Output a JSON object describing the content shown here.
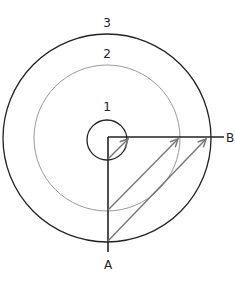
{
  "diagram": {
    "circles": [
      {
        "label": "1",
        "r": 20,
        "stroke": "#222222"
      },
      {
        "label": "2",
        "r": 73,
        "stroke": "#999999"
      },
      {
        "label": "3",
        "r": 104,
        "stroke": "#222222"
      }
    ],
    "axes": {
      "vertical_label": "A",
      "horizontal_label": "B"
    },
    "arrow_color": "#777777"
  }
}
